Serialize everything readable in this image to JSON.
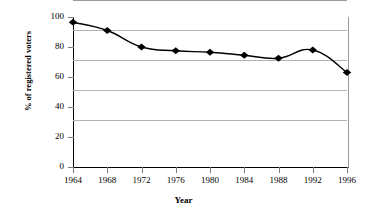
{
  "chart_data": {
    "type": "line",
    "title": "",
    "xlabel": "Year",
    "ylabel": "% of registered voters",
    "categories": [
      "1964",
      "1968",
      "1972",
      "1976",
      "1980",
      "1984",
      "1988",
      "1992",
      "1996"
    ],
    "x": [
      1964,
      1968,
      1972,
      1976,
      1980,
      1984,
      1988,
      1992,
      1996
    ],
    "values": [
      96.5,
      91,
      80,
      77.5,
      76.5,
      74.5,
      72.5,
      78,
      63
    ],
    "series": [
      {
        "name": "% of registered voters",
        "values": [
          96.5,
          91,
          80,
          77.5,
          76.5,
          74.5,
          72.5,
          78,
          63
        ]
      }
    ],
    "ylim": [
      0,
      100
    ],
    "yticks": [
      0,
      20,
      40,
      60,
      80,
      100
    ],
    "ytick_labels": [
      "0",
      "20",
      "40",
      "60",
      "80",
      "100"
    ],
    "xtick_labels": [
      "1964",
      "1968",
      "1972",
      "1976",
      "1980",
      "1984",
      "1988",
      "1992",
      "1996"
    ],
    "grid": "horizontal",
    "legend": "none",
    "marker": "diamond",
    "line_color": "#000000",
    "marker_color": "#000000",
    "grid_color": "#b3b3b3",
    "axis_color": "#000000",
    "background": "#ffffff"
  }
}
